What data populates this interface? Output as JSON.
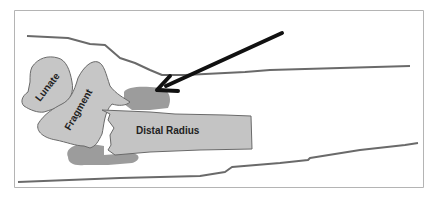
{
  "diagram": {
    "title": "",
    "labels": {
      "lunate": "Lunate",
      "fragment": "Fragment",
      "distal_radius": "Distal Radius"
    },
    "colors": {
      "bone_fill": "#c4c4c4",
      "bone_stroke": "#6e6e6e",
      "callus_fill": "#9a9a9a",
      "outline": "#5a5a5a",
      "arrow": "#111111",
      "frame": "#b0b0b0",
      "background": "#ffffff"
    },
    "annotations": [
      {
        "type": "arrow",
        "points_to": "callus-region-dorsal"
      }
    ]
  }
}
